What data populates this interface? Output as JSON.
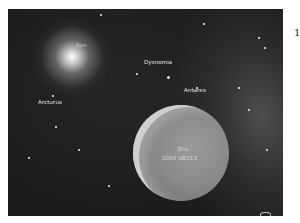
{
  "image": {
    "description": "Artist illustration of the dwarf planet Eris with its moon Dysnomia against a starfield",
    "labels": {
      "sun": "Sun",
      "dysnomia": "Dysnomia",
      "antares": "Antares",
      "arcturus": "Arcturus",
      "eris_name": "Eris",
      "eris_designation": "2003 UB313"
    }
  },
  "page_number": "1"
}
